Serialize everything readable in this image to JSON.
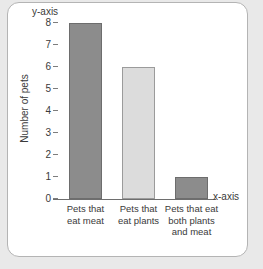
{
  "figure": {
    "y_axis_annotation": "y-axis",
    "x_axis_annotation": "x-axis",
    "y_axis_title": "Number of pets"
  },
  "chart_data": {
    "type": "bar",
    "title": "",
    "xlabel": "",
    "ylabel": "Number of pets",
    "categories": [
      "Pets that\neat meat",
      "Pets that\neat plants",
      "Pets that eat\nboth plants\nand meat"
    ],
    "category_lines": [
      [
        "Pets that",
        "eat meat"
      ],
      [
        "Pets that",
        "eat plants"
      ],
      [
        "Pets that eat",
        "both plants",
        "and meat"
      ]
    ],
    "values": [
      8,
      6,
      1
    ],
    "ylim": [
      0,
      8
    ],
    "ytick_labels": [
      "8",
      "7",
      "6",
      "5",
      "4",
      "3",
      "2",
      "1",
      "0"
    ],
    "ytick_values": [
      8,
      7,
      6,
      5,
      4,
      3,
      2,
      1,
      0
    ],
    "grid": false,
    "legend": "none",
    "bar_colors": [
      "#8c8c8c",
      "#dcdcdc",
      "#8c8c8c"
    ],
    "bar_border_colors": [
      "#6d6d6d",
      "#9b9b9b",
      "#6d6d6d"
    ],
    "annotations": [
      "y-axis",
      "x-axis"
    ]
  },
  "style": {
    "page_background": "#e9e9e9",
    "card_background": "#ffffff",
    "card_border": "#b4b4b4",
    "axis_color": "#6e6e6e",
    "text_color": "#3a3a3a"
  }
}
